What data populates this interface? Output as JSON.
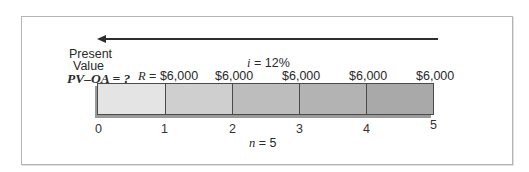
{
  "diagram": {
    "title_arrow_label": "Present Value",
    "present_value_line1": "Present",
    "present_value_line2": "Value",
    "pv_label": "PV–OA = ?",
    "rate_label": "i = 12%",
    "rate_var": "i",
    "rate_rest": " = 12%",
    "payment_first_var": "R",
    "payment_first_rest": " = $6,000",
    "payments": [
      "$6,000",
      "$6,000",
      "$6,000",
      "$6,000",
      "$6,000"
    ],
    "periods": [
      "0",
      "1",
      "2",
      "3",
      "4",
      "5"
    ],
    "n_var": "n",
    "n_rest": " = 5",
    "segment_colors": [
      "#e4e4e4",
      "#cfcfcf",
      "#bdbdbd",
      "#b3b3b3",
      "#a9a9a9"
    ],
    "arrow_direction": "left",
    "colors": {
      "frame": "#b4b4b4",
      "arrow": "#2e2e2e",
      "bar_border": "#4a4a4a",
      "bar_shadow": "#9a9a9a"
    }
  }
}
